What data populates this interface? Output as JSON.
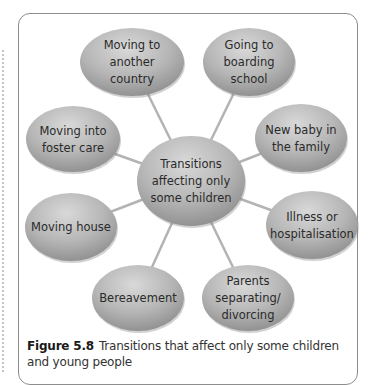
{
  "diagram": {
    "type": "spider-diagram",
    "center": {
      "id": "center",
      "lines": [
        "Transitions",
        "affecting only",
        "some children"
      ],
      "cx": 191,
      "cy": 181,
      "rx": 54,
      "ry": 45
    },
    "nodes": [
      {
        "id": "moving-to-another-country",
        "lines": [
          "Moving to",
          "another",
          "country"
        ],
        "cx": 132,
        "cy": 62,
        "rx": 52,
        "ry": 34
      },
      {
        "id": "going-to-boarding-school",
        "lines": [
          "Going to",
          "boarding",
          "school"
        ],
        "cx": 249,
        "cy": 62,
        "rx": 46,
        "ry": 34
      },
      {
        "id": "moving-into-foster-care",
        "lines": [
          "Moving into",
          "foster care"
        ],
        "cx": 73,
        "cy": 139,
        "rx": 47,
        "ry": 33
      },
      {
        "id": "new-baby-in-the-family",
        "lines": [
          "New baby in",
          "the family"
        ],
        "cx": 301,
        "cy": 138,
        "rx": 46,
        "ry": 34
      },
      {
        "id": "moving-house",
        "lines": [
          "Moving house"
        ],
        "cx": 71,
        "cy": 227,
        "rx": 46,
        "ry": 34
      },
      {
        "id": "illness-or-hospitalisation",
        "lines": [
          "Illness or",
          "hospitalisation"
        ],
        "cx": 312,
        "cy": 225,
        "rx": 46,
        "ry": 34
      },
      {
        "id": "bereavement",
        "lines": [
          "Bereavement"
        ],
        "cx": 138,
        "cy": 298,
        "rx": 46,
        "ry": 33
      },
      {
        "id": "parents-separating-divorcing",
        "lines": [
          "Parents",
          "separating/",
          "divorcing"
        ],
        "cx": 248,
        "cy": 298,
        "rx": 46,
        "ry": 33
      }
    ],
    "colors": {
      "node_fill_light": "#d6d6d6",
      "node_fill_mid": "#b4b4b4",
      "node_fill_dark": "#8e8e8e",
      "connector": "#b3b3b3",
      "frame": "#8d8d8d",
      "text": "#2a2a2a"
    }
  },
  "caption": {
    "figure_number": "Figure 5.8",
    "text": "Transitions that affect only some children and young people"
  }
}
